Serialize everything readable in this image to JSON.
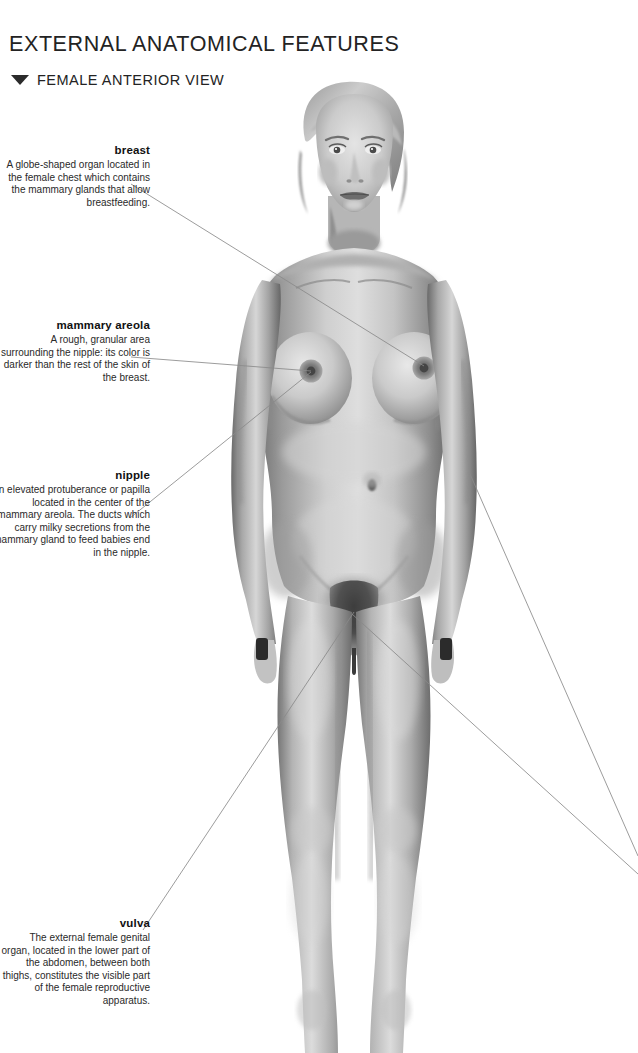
{
  "header": {
    "title": "EXTERNAL ANATOMICAL FEATURES",
    "subtitle": "FEMALE ANTERIOR VIEW",
    "marker_icon": "triangle-down-icon"
  },
  "figure": {
    "style": "pencil-shaded grayscale rendering"
  },
  "annotations": [
    {
      "id": "breast",
      "term": "breast",
      "description": "A globe-shaped organ located in the female chest which contains the mammary glands that allow breastfeeding."
    },
    {
      "id": "mammary-areola",
      "term": "mammary areola",
      "description": "A rough, granular area surrounding the nipple: its color is darker than the rest of the skin of the breast."
    },
    {
      "id": "nipple",
      "term": "nipple",
      "description": "An elevated protuberance or papilla located in the center of the mammary areola. The ducts which carry milky secretions from the mammary gland to feed babies end in the nipple."
    },
    {
      "id": "vulva",
      "term": "vulva",
      "description": "The external female genital organ, located in the lower part of the abdomen, between both thighs, constitutes the visible part of the female reproductive apparatus."
    }
  ],
  "colors": {
    "background": "#ffffff",
    "title_text": "#232323",
    "body_text": "#2a2a2a",
    "term_text": "#111111",
    "leader_line": "#8a8a8a"
  }
}
